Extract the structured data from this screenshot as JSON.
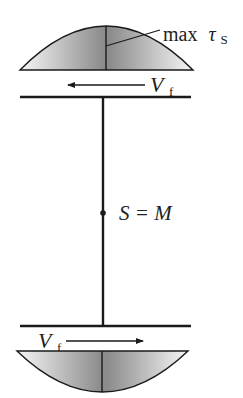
{
  "diagram": {
    "top_distribution": {
      "label_prefix": "max",
      "label_symbol": "τ",
      "label_subscript": "S"
    },
    "top_force": {
      "symbol": "V",
      "subscript": "f",
      "direction": "left"
    },
    "center_label": {
      "text": "S = M"
    },
    "bottom_force": {
      "symbol": "V",
      "subscript": "f",
      "direction": "right"
    },
    "colors": {
      "stroke": "#1a1a1a",
      "shade_dark": "#8a8a8a",
      "shade_light": "#f4f4f4"
    }
  }
}
